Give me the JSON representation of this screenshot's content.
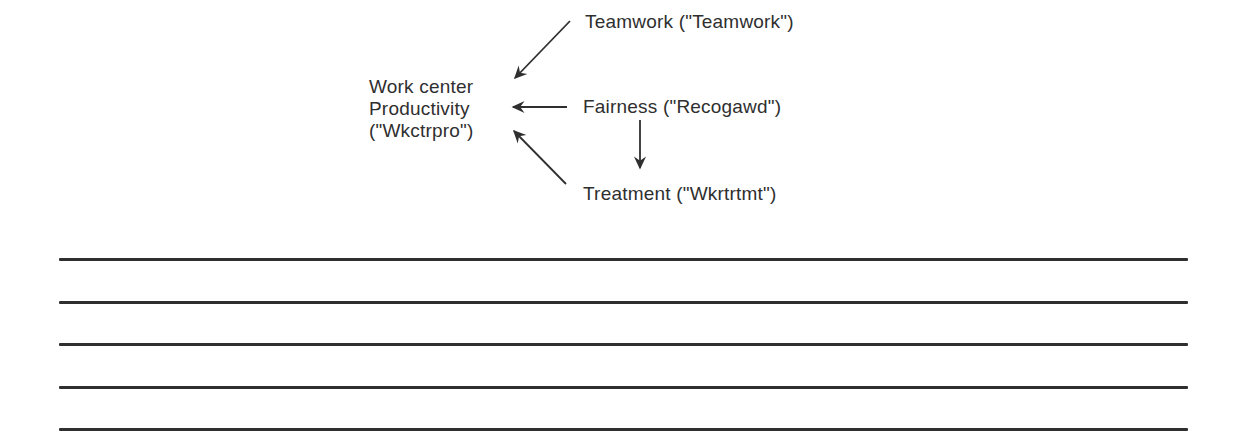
{
  "diagram": {
    "nodes": {
      "teamwork": {
        "label": "Teamwork (\"Teamwork\")"
      },
      "productivity": {
        "line1": "Work center",
        "line2": "Productivity",
        "line3": "(\"Wkctrpro\")"
      },
      "fairness": {
        "label": "Fairness (\"Recogawd\")"
      },
      "treatment": {
        "label": "Treatment (\"Wkrtrtmt\")"
      }
    },
    "edges": [
      {
        "from": "Teamwork (\"Teamwork\")",
        "to": "Work center Productivity (\"Wkctrpro\")"
      },
      {
        "from": "Fairness (\"Recogawd\")",
        "to": "Work center Productivity (\"Wkctrpro\")"
      },
      {
        "from": "Fairness (\"Recogawd\")",
        "to": "Treatment (\"Wkrtrtmt\")"
      },
      {
        "from": "Treatment (\"Wkrtrtmt\")",
        "to": "Work center Productivity (\"Wkctrpro\")"
      }
    ]
  },
  "ruled_lines": {
    "count": 5
  },
  "colors": {
    "ink": "#2f2f2f",
    "background": "#ffffff"
  }
}
